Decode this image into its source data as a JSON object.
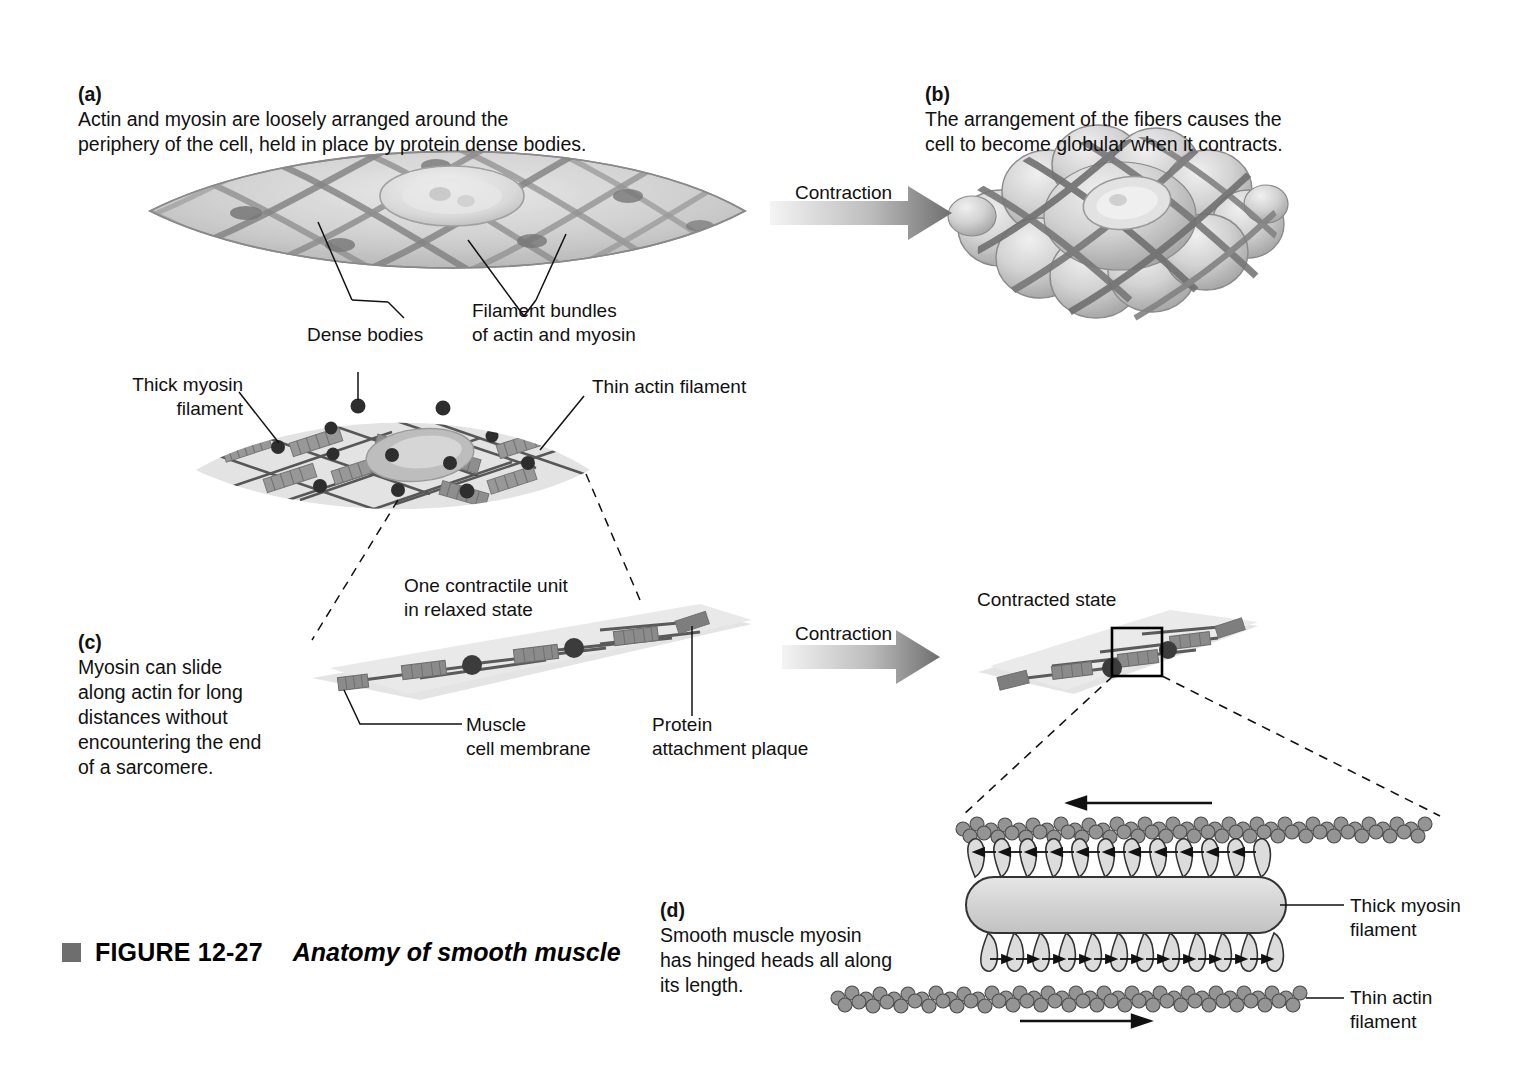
{
  "figure": {
    "bullet": "gray-square-bullet",
    "number": "FIGURE 12-27",
    "title": "Anatomy of smooth muscle"
  },
  "panels": {
    "a": {
      "tag": "(a)",
      "text": "Actin and myosin are loosely arranged around the\nperiphery of the cell, held in place by protein dense bodies."
    },
    "b": {
      "tag": "(b)",
      "text": "The arrangement of the fibers causes the\ncell to become globular when it contracts."
    },
    "c": {
      "tag": "(c)",
      "text": "Myosin can slide\nalong actin for long\ndistances without\nencountering the end\nof a sarcomere."
    },
    "d": {
      "tag": "(d)",
      "text": "Smooth muscle myosin\nhas hinged heads all along\nits length."
    }
  },
  "labels": {
    "dense_bodies": "Dense bodies",
    "filament_bundles": "Filament bundles\nof actin and myosin",
    "thick_myosin_filament_top": "Thick myosin\nfilament",
    "thin_actin_filament_top": "Thin actin filament",
    "contraction_top": "Contraction",
    "contraction_mid": "Contraction",
    "one_contractile_unit": "One contractile unit\nin relaxed state",
    "contracted_state": "Contracted state",
    "muscle_cell_membrane": "Muscle\ncell membrane",
    "protein_attachment_plaque": "Protein\nattachment plaque",
    "thick_myosin_filament_d": "Thick myosin\nfilament",
    "thin_actin_filament_d": "Thin actin\nfilament"
  },
  "colors": {
    "ink": "#111111",
    "cell_fill": "#d8d8d8",
    "cell_fill_light": "#e4e4e4",
    "fiber_dark": "#6a6a6a",
    "myosin_block": "#8c8c8c",
    "dense_body": "#3a3a3a",
    "arrow_gradient_start": "#f2f2f2",
    "arrow_gradient_end": "#6e6e6e",
    "bead": "#8f8f8f",
    "caption_bullet": "#6e6e6e"
  },
  "graphics": {
    "relaxed_cell_a": "spindle-shaped-smooth-muscle-cell-with-crosshatch-fibers-and-nucleus",
    "globular_cell_b": "contracted-globular-smooth-muscle-cell",
    "relaxed_cell_mid": "lens-shaped-cell-with-actin-myosin-and-dense-bodies",
    "contractile_unit_relaxed": "relaxed-contractile-unit-staircase",
    "contractile_unit_contracted": "contracted-contractile-unit-staircase",
    "myosin_detail_d": "thick-myosin-filament-with-hinged-heads-and-two-actin-filaments"
  }
}
